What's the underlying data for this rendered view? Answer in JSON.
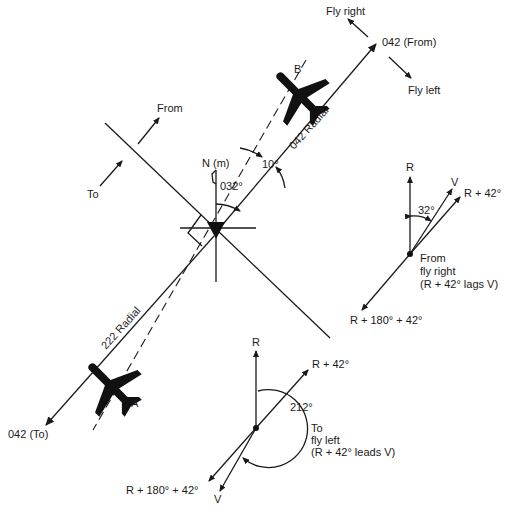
{
  "diagram": {
    "station": {
      "north_label": "N (m)",
      "bearing_label": "032°",
      "offset_label": "10°"
    },
    "radials": {
      "upper_label": "042 Radial",
      "lower_label": "222 Radial",
      "from_end_label": "042 (From)",
      "to_end_label": "042 (To)"
    },
    "turn_arrows": {
      "fly_right": "Fly right",
      "fly_left": "Fly left"
    },
    "sector_arrows": {
      "from": "From",
      "to": "To"
    },
    "aircraft": [
      {
        "id": "B",
        "label": "B"
      },
      {
        "id": "A",
        "label": "A"
      }
    ],
    "from_vectors": {
      "r_label": "R",
      "v_label": "V",
      "r42_label": "R + 42°",
      "angle_label": "32°",
      "recip_label": "R + 180° + 42°",
      "note_line1": "From",
      "note_line2": "fly right",
      "note_line3": "(R + 42° lags V)"
    },
    "to_vectors": {
      "r_label": "R",
      "r42_label": "R + 42°",
      "angle_label": "212°",
      "recip_label": "R + 180° + 42°",
      "v_label": "V",
      "note_line1": "To",
      "note_line2": "fly left",
      "note_line3": "(R + 42° leads V)"
    }
  }
}
